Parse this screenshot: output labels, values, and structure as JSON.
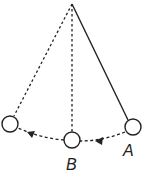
{
  "diagram": {
    "title": "",
    "type": "pendulum-swing",
    "labels": {
      "A": "A",
      "B": "B"
    },
    "colors": {
      "stroke": "#222222",
      "background": "#ffffff"
    }
  }
}
